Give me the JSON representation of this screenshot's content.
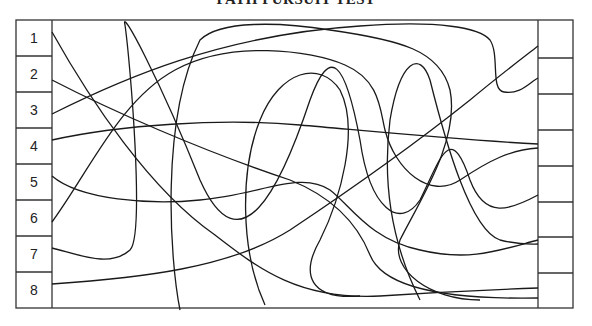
{
  "title": "PATH PURSUIT TEST",
  "left_boxes": [
    {
      "label": "1"
    },
    {
      "label": "2"
    },
    {
      "label": "3"
    },
    {
      "label": "4"
    },
    {
      "label": "5"
    },
    {
      "label": "6"
    },
    {
      "label": "7"
    },
    {
      "label": "8"
    }
  ],
  "right_boxes": [
    {
      "label": ""
    },
    {
      "label": ""
    },
    {
      "label": ""
    },
    {
      "label": ""
    },
    {
      "label": ""
    },
    {
      "label": ""
    },
    {
      "label": ""
    },
    {
      "label": ""
    }
  ],
  "colors": {
    "line": "#1a1a1a",
    "frame": "#333333",
    "background": "#ffffff"
  }
}
